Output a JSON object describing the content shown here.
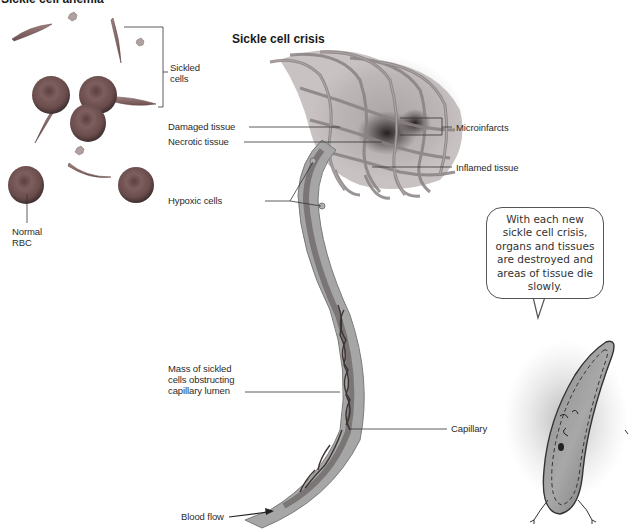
{
  "header": {
    "main_title": "Sickle cell anemia",
    "section_title": "Sickle cell crisis"
  },
  "left_panel": {
    "labels": {
      "sickled_cells": [
        "Sickled",
        "cells"
      ],
      "normal_rbc": [
        "Normal",
        "RBC"
      ]
    }
  },
  "crisis_labels": {
    "damaged_tissue": "Damaged tissue",
    "necrotic_tissue": "Necrotic tissue",
    "hypoxic_cells": "Hypoxic cells",
    "microinfarcts": "Microinfarcts",
    "inflamed_tissue": "Inflamed tissue",
    "mass_sickled": [
      "Mass of sickled",
      "cells obstructing",
      "capillary lumen"
    ],
    "capillary": "Capillary",
    "blood_flow": "Blood flow"
  },
  "speech_bubble": {
    "text": "With each new sickle cell crisis, organs and tissues are destroyed and areas of tissue die slowly."
  },
  "colors": {
    "rbc_fill": "#7a5a5a",
    "vessel": "#9a9a9a",
    "tissue_dark": "#3a3030",
    "line": "#333333"
  }
}
